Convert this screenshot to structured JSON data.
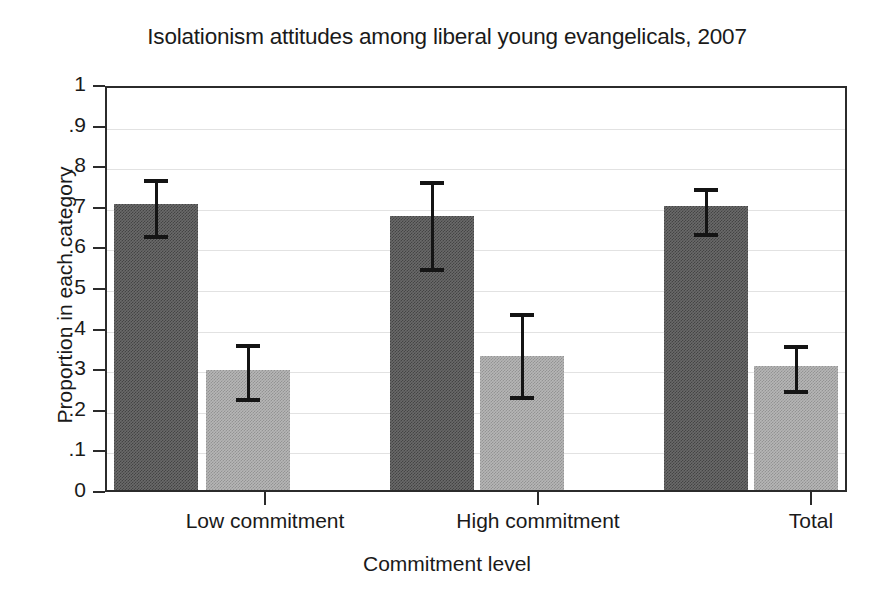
{
  "chart_data": {
    "type": "bar",
    "title": "Isolationism attitudes among liberal young evangelicals, 2007",
    "xlabel": "Commitment level",
    "ylabel": "Proportion in each category",
    "categories": [
      "Low commitment",
      "High commitment",
      "Total"
    ],
    "ylim": [
      0,
      1
    ],
    "yticks": [
      "0",
      ".1",
      ".2",
      ".3",
      ".4",
      ".5",
      ".6",
      ".7",
      ".8",
      ".9",
      "1"
    ],
    "ytick_values": [
      0,
      0.1,
      0.2,
      0.3,
      0.4,
      0.5,
      0.6,
      0.7,
      0.8,
      0.9,
      1
    ],
    "grid": true,
    "legend": "none",
    "error_bars": "95% confidence interval",
    "series": [
      {
        "name": "Agree / isolationist",
        "color": "#6a6a6a",
        "values": [
          0.705,
          0.674,
          0.7
        ],
        "ci_low": [
          0.629,
          0.546,
          0.632
        ],
        "ci_high": [
          0.776,
          0.77,
          0.753
        ]
      },
      {
        "name": "Disagree / non-isolationist",
        "color": "#b6b6b6",
        "values": [
          0.296,
          0.331,
          0.306
        ],
        "ci_low": [
          0.227,
          0.232,
          0.247
        ],
        "ci_high": [
          0.37,
          0.447,
          0.368
        ]
      }
    ]
  }
}
